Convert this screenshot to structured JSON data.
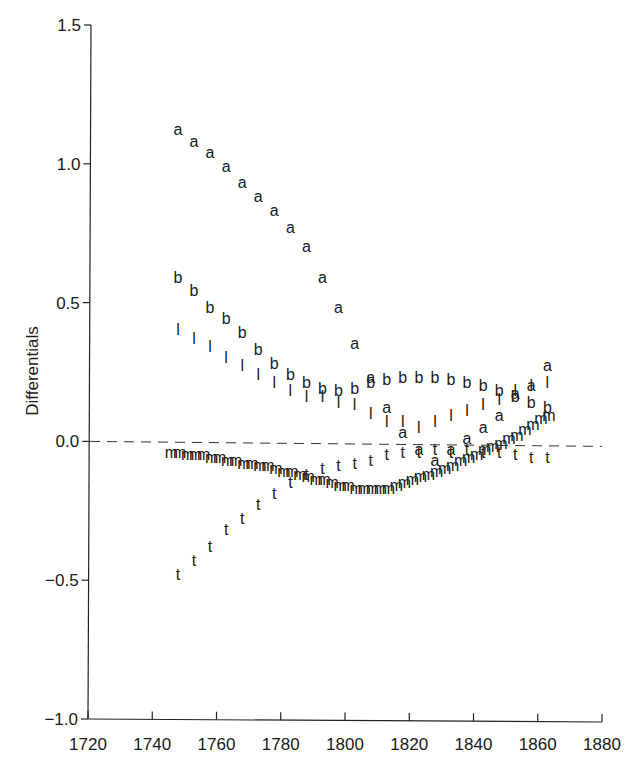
{
  "chart_data": {
    "type": "scatter",
    "title": "",
    "xlabel": "",
    "ylabel": "Differentials",
    "xlim": [
      1720,
      1880
    ],
    "ylim": [
      -1.0,
      1.5
    ],
    "x_ticks": [
      1720,
      1740,
      1760,
      1780,
      1800,
      1820,
      1840,
      1860,
      1880
    ],
    "x_tick_labels": [
      "1720",
      "1740",
      "1760",
      "1780",
      "1800",
      "1820",
      "1840",
      "1860",
      "1880"
    ],
    "y_ticks": [
      -1.0,
      -0.5,
      0.0,
      0.5,
      1.0,
      1.5
    ],
    "y_tick_labels": [
      "−1.0",
      "−0.5",
      "0.0",
      "0.5",
      "1.0",
      "1.5"
    ],
    "grid": false,
    "legend": "none (series identified by letter markers)",
    "reference_line": {
      "y": 0.0,
      "style": "dashed"
    },
    "series": [
      {
        "name": "a",
        "marker": "a",
        "x": [
          1748,
          1753,
          1758,
          1763,
          1768,
          1773,
          1778,
          1783,
          1788,
          1793,
          1798,
          1803,
          1808,
          1813,
          1818,
          1823,
          1828,
          1833,
          1838,
          1843,
          1848,
          1853,
          1858,
          1863
        ],
        "values": [
          1.12,
          1.08,
          1.04,
          0.99,
          0.93,
          0.88,
          0.83,
          0.77,
          0.7,
          0.59,
          0.48,
          0.35,
          0.23,
          0.12,
          0.03,
          -0.03,
          -0.07,
          -0.03,
          0.01,
          0.05,
          0.09,
          0.17,
          0.2,
          0.27
        ]
      },
      {
        "name": "b",
        "marker": "b",
        "x": [
          1748,
          1753,
          1758,
          1763,
          1768,
          1773,
          1778,
          1783,
          1788,
          1793,
          1798,
          1803,
          1808,
          1813,
          1818,
          1823,
          1828,
          1833,
          1838,
          1843,
          1848,
          1853,
          1858,
          1863
        ],
        "values": [
          0.59,
          0.54,
          0.48,
          0.44,
          0.39,
          0.33,
          0.28,
          0.24,
          0.21,
          0.19,
          0.18,
          0.19,
          0.21,
          0.22,
          0.23,
          0.23,
          0.23,
          0.22,
          0.21,
          0.2,
          0.18,
          0.16,
          0.14,
          0.12
        ]
      },
      {
        "name": "l",
        "marker": "l",
        "x": [
          1748,
          1753,
          1758,
          1763,
          1768,
          1773,
          1778,
          1783,
          1788,
          1793,
          1798,
          1803,
          1808,
          1813,
          1818,
          1823,
          1828,
          1833,
          1838,
          1843,
          1848,
          1853,
          1858,
          1863
        ],
        "values": [
          0.4,
          0.37,
          0.34,
          0.3,
          0.27,
          0.24,
          0.21,
          0.18,
          0.16,
          0.16,
          0.14,
          0.13,
          0.1,
          0.07,
          0.07,
          0.05,
          0.07,
          0.09,
          0.11,
          0.13,
          0.15,
          0.18,
          0.2,
          0.21
        ]
      },
      {
        "name": "t",
        "marker": "t",
        "x": [
          1748,
          1753,
          1758,
          1763,
          1768,
          1773,
          1778,
          1783,
          1788,
          1793,
          1798,
          1803,
          1808,
          1813,
          1818,
          1823,
          1828,
          1833,
          1838,
          1843,
          1848,
          1853,
          1858,
          1863
        ],
        "values": [
          -0.48,
          -0.43,
          -0.38,
          -0.32,
          -0.28,
          -0.23,
          -0.19,
          -0.15,
          -0.12,
          -0.1,
          -0.09,
          -0.08,
          -0.07,
          -0.05,
          -0.04,
          -0.04,
          -0.03,
          -0.04,
          -0.03,
          -0.04,
          -0.04,
          -0.05,
          -0.06,
          -0.06
        ]
      },
      {
        "name": "m",
        "marker": "m",
        "x": [
          1746,
          1748.5,
          1751,
          1753.5,
          1756,
          1758.5,
          1761,
          1763.5,
          1766,
          1768.5,
          1771,
          1773.5,
          1776,
          1778.5,
          1781,
          1783.5,
          1786,
          1788.5,
          1791,
          1793.5,
          1796,
          1798.5,
          1801,
          1803.5,
          1806,
          1808.5,
          1811,
          1813.5,
          1816,
          1818.5,
          1821,
          1823.5,
          1826,
          1828.5,
          1831,
          1833.5,
          1836,
          1838.5,
          1841,
          1843.5,
          1846,
          1848.5,
          1851,
          1853.5,
          1856,
          1858.5,
          1861,
          1863.5
        ],
        "values": [
          -0.04,
          -0.04,
          -0.05,
          -0.05,
          -0.05,
          -0.06,
          -0.06,
          -0.07,
          -0.07,
          -0.08,
          -0.08,
          -0.09,
          -0.09,
          -0.1,
          -0.11,
          -0.11,
          -0.12,
          -0.13,
          -0.14,
          -0.14,
          -0.15,
          -0.16,
          -0.16,
          -0.17,
          -0.17,
          -0.17,
          -0.17,
          -0.17,
          -0.16,
          -0.15,
          -0.14,
          -0.13,
          -0.12,
          -0.11,
          -0.1,
          -0.09,
          -0.07,
          -0.06,
          -0.05,
          -0.03,
          -0.02,
          -0.01,
          0.01,
          0.02,
          0.04,
          0.06,
          0.08,
          0.09
        ]
      }
    ]
  }
}
